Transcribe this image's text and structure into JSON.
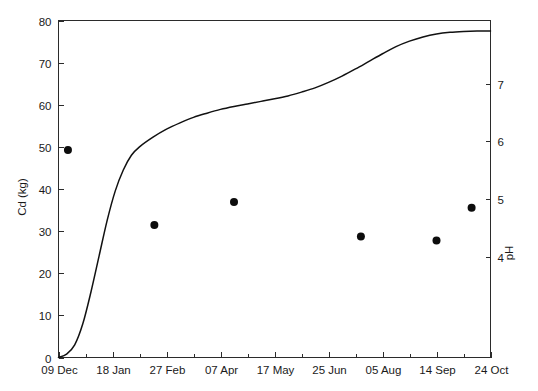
{
  "chart_data": {
    "type": "line",
    "title": "",
    "xlabel": "",
    "ylabel": "Cd (kg)",
    "y2label": "pH",
    "grid": false,
    "legend": null,
    "xlim": [
      0,
      16
    ],
    "ylim": [
      0,
      80
    ],
    "y2lim": [
      2.25,
      8.1
    ],
    "x_tick_labels": [
      "09 Dec",
      "18 Jan",
      "27 Feb",
      "07 Apr",
      "17 May",
      "25 Jun",
      "05 Aug",
      "14 Sep",
      "24 Oct"
    ],
    "x_major_tick_values": [
      0,
      2,
      4,
      6,
      8,
      10,
      12,
      14,
      16
    ],
    "x_minor_tick_values": [
      1,
      3,
      5,
      7,
      9,
      11,
      13,
      15
    ],
    "y_tick_labels": [
      "0",
      "10",
      "20",
      "30",
      "40",
      "50",
      "60",
      "70",
      "80"
    ],
    "y_tick_values": [
      0,
      10,
      20,
      30,
      40,
      50,
      60,
      70,
      80
    ],
    "y2_tick_labels": [
      "4",
      "5",
      "6",
      "7"
    ],
    "y2_tick_values": [
      4,
      5,
      6,
      7
    ],
    "series": [
      {
        "name": "Cumulative Cd released (kg)",
        "type": "line",
        "axis": "left",
        "x": [
          0.0,
          0.3,
          0.6,
          0.9,
          1.2,
          1.5,
          1.8,
          2.1,
          2.4,
          2.7,
          3.0,
          3.5,
          4.0,
          4.5,
          5.0,
          5.5,
          6.0,
          6.5,
          7.0,
          7.5,
          8.0,
          8.5,
          9.0,
          9.5,
          10.0,
          10.5,
          11.0,
          11.5,
          12.0,
          12.5,
          13.0,
          13.5,
          14.0,
          14.5,
          15.0,
          15.5,
          16.0
        ],
        "y": [
          0.0,
          0.8,
          3.0,
          8.0,
          15.5,
          24.0,
          32.5,
          39.5,
          44.5,
          48.0,
          50.0,
          52.3,
          54.2,
          55.7,
          57.0,
          58.0,
          58.9,
          59.6,
          60.2,
          60.8,
          61.4,
          62.1,
          63.0,
          64.0,
          65.3,
          66.8,
          68.5,
          70.3,
          72.1,
          73.8,
          75.1,
          76.1,
          76.8,
          77.2,
          77.4,
          77.5,
          77.5
        ]
      },
      {
        "name": "pH measurements",
        "type": "scatter",
        "axis": "right",
        "x": [
          0.35,
          3.55,
          6.5,
          11.2,
          14.0,
          15.3
        ],
        "y": [
          5.85,
          4.55,
          4.95,
          4.35,
          4.28,
          4.85
        ]
      }
    ],
    "scatter_left_axis_equivalent_y": [
      28.0,
      20.8,
      23.0,
      20.0,
      19.6,
      22.3
    ]
  },
  "axes": {
    "left_title": "Cd (kg)",
    "right_title": "pH"
  }
}
